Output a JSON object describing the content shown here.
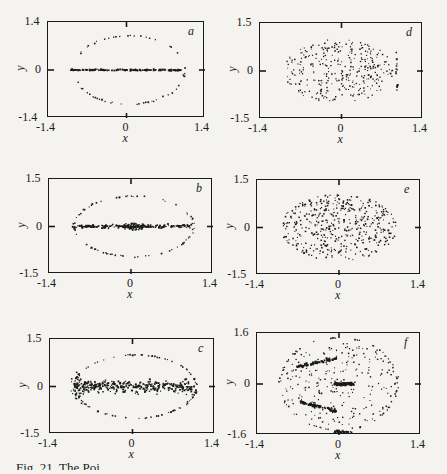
{
  "figure": {
    "caption": "Fig. 21. The Poi"
  },
  "chart_data": [
    {
      "id": "a",
      "type": "scatter",
      "letter": "a",
      "title": "",
      "xlabel": "x",
      "ylabel": "y",
      "xlim": [
        -1.4,
        1.4
      ],
      "ylim": [
        -1.4,
        1.4
      ],
      "xticks": [
        "-1.4",
        "0",
        "1.4"
      ],
      "yticks": [
        "1.4",
        "0",
        "-1.4"
      ],
      "grid": false,
      "box": {
        "left": 47,
        "top": 21,
        "width": 157,
        "height": 96
      },
      "structures": [
        {
          "kind": "ellipse",
          "cx": 0.05,
          "cy": 0.0,
          "rx": 1.0,
          "ry": 1.0,
          "n": 60,
          "size": 1.2
        },
        {
          "kind": "band",
          "x0": -1.0,
          "x1": 1.0,
          "y": 0.0,
          "spread": 0.01,
          "n": 160,
          "size": 1.4
        }
      ],
      "description": "Single elliptical invariant curve (x from -1.0 to 1.0, y from -1.0 to 1.0) with a dense horizontal line along y=0"
    },
    {
      "id": "b",
      "type": "scatter",
      "letter": "b",
      "title": "",
      "xlabel": "x",
      "ylabel": "y",
      "xlim": [
        -1.4,
        1.4
      ],
      "ylim": [
        -1.5,
        1.5
      ],
      "xticks": [
        "-1.4",
        "0",
        "1.4"
      ],
      "yticks": [
        "1.5",
        "0",
        "-1.5"
      ],
      "grid": false,
      "box": {
        "left": 48,
        "top": 178,
        "width": 164,
        "height": 95
      },
      "structures": [
        {
          "kind": "ellipse",
          "cx": 0.05,
          "cy": 0.0,
          "rx": 1.02,
          "ry": 0.95,
          "n": 80,
          "size": 1.2
        },
        {
          "kind": "band",
          "x0": -1.0,
          "x1": 1.05,
          "y": 0.0,
          "spread": 0.03,
          "n": 180,
          "size": 1.4
        },
        {
          "kind": "cloud",
          "cx": 0.05,
          "cy": 0.0,
          "rx": 0.2,
          "ry": 0.12,
          "n": 60,
          "size": 1.2
        }
      ],
      "description": "Elliptical curve with horizontal line at y=0 and small chaotic cluster near the origin"
    },
    {
      "id": "c",
      "type": "scatter",
      "letter": "c",
      "title": "",
      "xlabel": "x",
      "ylabel": "y",
      "xlim": [
        -1.4,
        1.4
      ],
      "ylim": [
        -1.5,
        1.5
      ],
      "xticks": [
        "-1.4",
        "0",
        "1.4"
      ],
      "yticks": [
        "1.5",
        "0",
        "-1.5"
      ],
      "grid": false,
      "box": {
        "left": 49,
        "top": 338,
        "width": 165,
        "height": 95
      },
      "structures": [
        {
          "kind": "ellipse",
          "cx": 0.05,
          "cy": 0.0,
          "rx": 1.03,
          "ry": 1.0,
          "n": 110,
          "size": 1.2
        },
        {
          "kind": "band",
          "x0": -0.95,
          "x1": 1.05,
          "y": 0.0,
          "spread": 0.1,
          "n": 320,
          "size": 1.4
        },
        {
          "kind": "cloud",
          "cx": -0.95,
          "cy": 0.0,
          "rx": 0.1,
          "ry": 0.45,
          "n": 40,
          "size": 1.2
        }
      ],
      "description": "Elliptical curve with a thickened chaotic band along y=0 (|y| up to ~0.2)"
    },
    {
      "id": "d",
      "type": "scatter",
      "letter": "d",
      "title": "",
      "xlabel": "x",
      "ylabel": "y",
      "xlim": [
        -1.4,
        1.4
      ],
      "ylim": [
        -1.5,
        1.5
      ],
      "xticks": [
        "-1.4",
        "0",
        "1.4"
      ],
      "yticks": [
        "1.5",
        "0",
        "-1.5"
      ],
      "grid": false,
      "box": {
        "left": 259,
        "top": 22,
        "width": 163,
        "height": 96
      },
      "structures": [
        {
          "kind": "cloud",
          "cx": -0.05,
          "cy": 0.0,
          "rx": 0.95,
          "ry": 1.0,
          "n": 330,
          "size": 1.1
        },
        {
          "kind": "vline",
          "x": 0.95,
          "y0": -0.6,
          "y1": 0.6,
          "n": 12,
          "size": 1.4
        }
      ],
      "description": "Scattered chaotic points filling an elliptical region (x from -1.0 to 0.9, |y| < 1.0) plus a short vertical string near x=0.95"
    },
    {
      "id": "e",
      "type": "scatter",
      "letter": "e",
      "title": "",
      "xlabel": "x",
      "ylabel": "y",
      "xlim": [
        -1.4,
        1.4
      ],
      "ylim": [
        -1.5,
        1.5
      ],
      "xticks": [
        "-1.4",
        "0",
        "1.4"
      ],
      "yticks": [
        "1.5",
        "0",
        "-1.5"
      ],
      "grid": false,
      "box": {
        "left": 256,
        "top": 179,
        "width": 164,
        "height": 95
      },
      "structures": [
        {
          "kind": "cloud",
          "cx": 0.0,
          "cy": 0.0,
          "rx": 1.0,
          "ry": 1.05,
          "n": 460,
          "size": 1.2
        }
      ],
      "description": "Dense chaotic sea filling elliptical region x in [-1.0, 1.0], |y| < 1.05"
    },
    {
      "id": "f",
      "type": "scatter",
      "letter": "f",
      "title": "",
      "xlabel": "x",
      "ylabel": "y",
      "xlim": [
        -1.4,
        1.4
      ],
      "ylim": [
        -1.6,
        1.6
      ],
      "xticks": [
        "-1.4",
        "0",
        "1.4"
      ],
      "yticks": [
        "1.6",
        "0",
        "-1.6"
      ],
      "grid": false,
      "box": {
        "left": 256,
        "top": 332,
        "width": 164,
        "height": 102
      },
      "structures": [
        {
          "kind": "ellipse",
          "cx": 0.0,
          "cy": 0.0,
          "rx": 1.0,
          "ry": 1.45,
          "n": 70,
          "size": 1.2
        },
        {
          "kind": "cloud",
          "cx": 0.05,
          "cy": 0.0,
          "rx": 1.0,
          "ry": 1.3,
          "n": 230,
          "size": 1.1
        },
        {
          "kind": "segment",
          "x0": -0.7,
          "y0": 0.55,
          "x1": -0.05,
          "y1": 0.8,
          "n": 60,
          "size": 1.6
        },
        {
          "kind": "segment",
          "x0": -0.7,
          "y0": -0.55,
          "x1": -0.05,
          "y1": -0.85,
          "n": 60,
          "size": 1.6
        },
        {
          "kind": "segment",
          "x0": -0.05,
          "y0": 0.0,
          "x1": 0.25,
          "y1": 0.0,
          "n": 50,
          "size": 1.8
        },
        {
          "kind": "segment",
          "x0": -0.1,
          "y0": -1.5,
          "x1": 0.2,
          "y1": -1.5,
          "n": 20,
          "size": 1.6
        }
      ],
      "description": "Scattered points with dense tilted island chains near (-0.4, 0.7) and (-0.4, -0.7), cluster at origin, and outer invariant curve near y=±1.45"
    }
  ]
}
